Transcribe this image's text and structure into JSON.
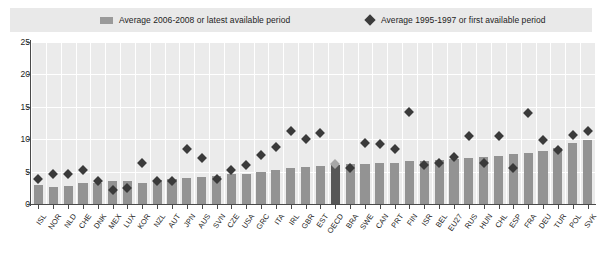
{
  "legend": {
    "bars_label": "Average 2006-2008 or latest available period",
    "diamonds_label": "Average 1995-1997 or first available period",
    "bar_swatch_icon": "bar-swatch",
    "diamond_swatch_icon": "diamond-swatch",
    "bar_color": "#939393",
    "diamond_color": "#3a3a3a",
    "background_color": "#e9e9e9"
  },
  "axis": {
    "y_ticks": [
      "0",
      "5",
      "10",
      "15",
      "20",
      "25"
    ],
    "x_count": 44
  },
  "chart_data": {
    "type": "bar",
    "title": "",
    "subtitle": "",
    "xlabel": "",
    "ylabel": "",
    "ylim": [
      0,
      25
    ],
    "ytick_step": 5,
    "grid": true,
    "legend_position": "top",
    "highlight_category": "OECD",
    "categories": [
      "ISL",
      "NOR",
      "NLD",
      "CHE",
      "DNK",
      "MEX",
      "LUX",
      "KOR",
      "NZL",
      "AUT",
      "JPN",
      "AUS",
      "SVN",
      "CZE",
      "USA",
      "GRC",
      "ITA",
      "IRL",
      "GBR",
      "EST",
      "OECD",
      "BRA",
      "SWE",
      "CAN",
      "PRT",
      "FIN",
      "ISR",
      "BEL",
      "EU27",
      "RUS",
      "HUN",
      "CHL",
      "ESP",
      "FRA",
      "DEU",
      "TUR",
      "POL",
      "SVK"
    ],
    "series": [
      {
        "name": "Average 2006-2008 or latest available period",
        "type": "bar",
        "color": "#939393",
        "values": [
          2.9,
          2.6,
          2.8,
          3.3,
          3.3,
          3.5,
          3.6,
          3.2,
          3.7,
          3.8,
          4.0,
          4.1,
          4.4,
          4.6,
          4.7,
          5.0,
          5.3,
          5.6,
          5.7,
          5.9,
          6.0,
          6.1,
          6.2,
          6.3,
          6.4,
          6.6,
          6.7,
          6.8,
          7.0,
          7.1,
          7.3,
          7.4,
          7.7,
          7.9,
          8.2,
          8.7,
          9.4,
          9.9
        ]
      },
      {
        "name": "Average 1995-1997 or first available period",
        "type": "scatter",
        "marker": "diamond",
        "color": "#3a3a3a",
        "values": [
          3.9,
          4.7,
          4.6,
          5.2,
          3.6,
          2.2,
          2.4,
          6.4,
          3.6,
          3.6,
          8.5,
          7.1,
          3.9,
          5.2,
          6.0,
          7.6,
          8.8,
          11.3,
          10.0,
          11.0,
          6.2,
          5.6,
          9.4,
          9.3,
          8.5,
          14.2,
          6.0,
          6.3,
          7.2,
          10.5,
          6.4,
          10.5,
          5.6,
          14.1,
          9.9,
          8.3,
          10.6,
          11.3
        ]
      }
    ]
  }
}
